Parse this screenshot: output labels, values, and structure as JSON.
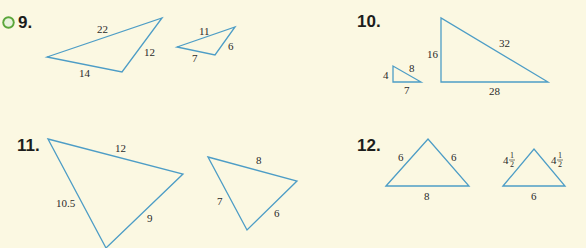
{
  "colors": {
    "background": "#fbf8e2",
    "triangle_stroke": "#4d9dc6",
    "icon_green": "#5aa63a",
    "text": "#1d1d1b"
  },
  "problems": [
    {
      "number": "9.",
      "has_video_icon": true,
      "icon": "play-circle-icon",
      "triangles": [
        {
          "points": [
            [
              47,
              57
            ],
            [
              162,
              18
            ],
            [
              122,
              72
            ]
          ],
          "labels": [
            "22",
            "12",
            "14"
          ]
        },
        {
          "points": [
            [
              177,
              47
            ],
            [
              235,
              27
            ],
            [
              215,
              55
            ]
          ],
          "labels": [
            "11",
            "6",
            "7"
          ]
        }
      ]
    },
    {
      "number": "10.",
      "has_video_icon": false,
      "triangles": [
        {
          "points": [
            [
              393,
              66
            ],
            [
              393,
              82
            ],
            [
              421,
              82
            ]
          ],
          "labels": [
            "4",
            "8",
            "7"
          ]
        },
        {
          "points": [
            [
              441,
              18
            ],
            [
              441,
              82
            ],
            [
              548,
              82
            ]
          ],
          "labels": [
            "16",
            "32",
            "28"
          ]
        }
      ]
    },
    {
      "number": "11.",
      "has_video_icon": false,
      "triangles": [
        {
          "points": [
            [
              48,
              139
            ],
            [
              183,
              174
            ],
            [
              106,
              248
            ]
          ],
          "labels": [
            "12",
            "9",
            "10.5"
          ]
        },
        {
          "points": [
            [
              208,
              157
            ],
            [
              297,
              181
            ],
            [
              247,
              230
            ]
          ],
          "labels": [
            "8",
            "6",
            "7"
          ]
        }
      ]
    },
    {
      "number": "12.",
      "has_video_icon": false,
      "triangles": [
        {
          "points": [
            [
              386,
              186
            ],
            [
              428,
              139
            ],
            [
              469,
              186
            ]
          ],
          "labels": [
            "6",
            "6",
            "8"
          ]
        },
        {
          "points": [
            [
              503,
              186
            ],
            [
              534,
              149
            ],
            [
              565,
              186
            ]
          ],
          "labels": [
            "4 1/2",
            "4 1/2",
            "6"
          ]
        }
      ]
    }
  ]
}
